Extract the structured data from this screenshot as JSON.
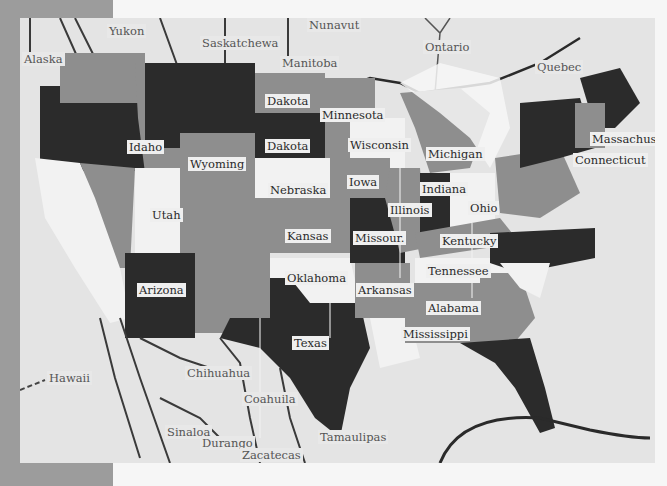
{
  "artwork": {
    "type": "painted map",
    "palette": {
      "frame": "#9c9c9c",
      "background": "#e4e4e4",
      "dark": "#2b2b2b",
      "mid": "#8e8e8e",
      "light": "#f2f2f2",
      "outline": "#3a3a3a"
    }
  },
  "labels": {
    "regions_foreign": [
      {
        "name": "Alaska",
        "x": 2,
        "y": 34
      },
      {
        "name": "Yukon",
        "x": 87,
        "y": 6
      },
      {
        "name": "Saskatchewan",
        "x": 180,
        "y": 18,
        "text": "Saskatchewa"
      },
      {
        "name": "Nunavut",
        "x": 287,
        "y": 0
      },
      {
        "name": "Manitoba",
        "x": 260,
        "y": 38
      },
      {
        "name": "Ontario",
        "x": 403,
        "y": 22
      },
      {
        "name": "Quebec",
        "x": 515,
        "y": 42
      },
      {
        "name": "Hawaii",
        "x": 27,
        "y": 353
      },
      {
        "name": "Chihuahua",
        "x": 165,
        "y": 348
      },
      {
        "name": "Coahuila",
        "x": 222,
        "y": 374
      },
      {
        "name": "Sinaloa",
        "x": 145,
        "y": 407
      },
      {
        "name": "Durango",
        "x": 180,
        "y": 418
      },
      {
        "name": "Zacatecas",
        "x": 220,
        "y": 430
      },
      {
        "name": "Tamaulipas",
        "x": 298,
        "y": 412
      }
    ],
    "states": [
      {
        "name": "Dakota",
        "x": 245,
        "y": 76
      },
      {
        "name": "Minnesota",
        "x": 300,
        "y": 90
      },
      {
        "name": "Idaho",
        "x": 107,
        "y": 122
      },
      {
        "name": "Dakota",
        "x": 245,
        "y": 121
      },
      {
        "name": "Wisconsin",
        "x": 328,
        "y": 120
      },
      {
        "name": "Michigan",
        "x": 406,
        "y": 129
      },
      {
        "name": "Massachusett",
        "x": 570,
        "y": 114
      },
      {
        "name": "Wyoming",
        "x": 168,
        "y": 139
      },
      {
        "name": "Connecticut",
        "x": 553,
        "y": 135
      },
      {
        "name": "Nebraska",
        "x": 248,
        "y": 165
      },
      {
        "name": "Iowa",
        "x": 327,
        "y": 157
      },
      {
        "name": "Indiana",
        "x": 400,
        "y": 164
      },
      {
        "name": "Utah",
        "x": 130,
        "y": 190
      },
      {
        "name": "Illinois",
        "x": 368,
        "y": 185
      },
      {
        "name": "Ohio",
        "x": 448,
        "y": 183
      },
      {
        "name": "Kansas",
        "x": 265,
        "y": 211
      },
      {
        "name": "Missouri",
        "x": 333,
        "y": 213,
        "text": "Missour."
      },
      {
        "name": "Kentucky",
        "x": 420,
        "y": 216
      },
      {
        "name": "Tennessee",
        "x": 406,
        "y": 246
      },
      {
        "name": "Oklahoma",
        "x": 265,
        "y": 253
      },
      {
        "name": "Arkansas",
        "x": 336,
        "y": 265
      },
      {
        "name": "Arizona",
        "x": 117,
        "y": 265
      },
      {
        "name": "Alabama",
        "x": 406,
        "y": 283
      },
      {
        "name": "Mississippi",
        "x": 381,
        "y": 309
      },
      {
        "name": "Texas",
        "x": 272,
        "y": 318
      }
    ]
  }
}
